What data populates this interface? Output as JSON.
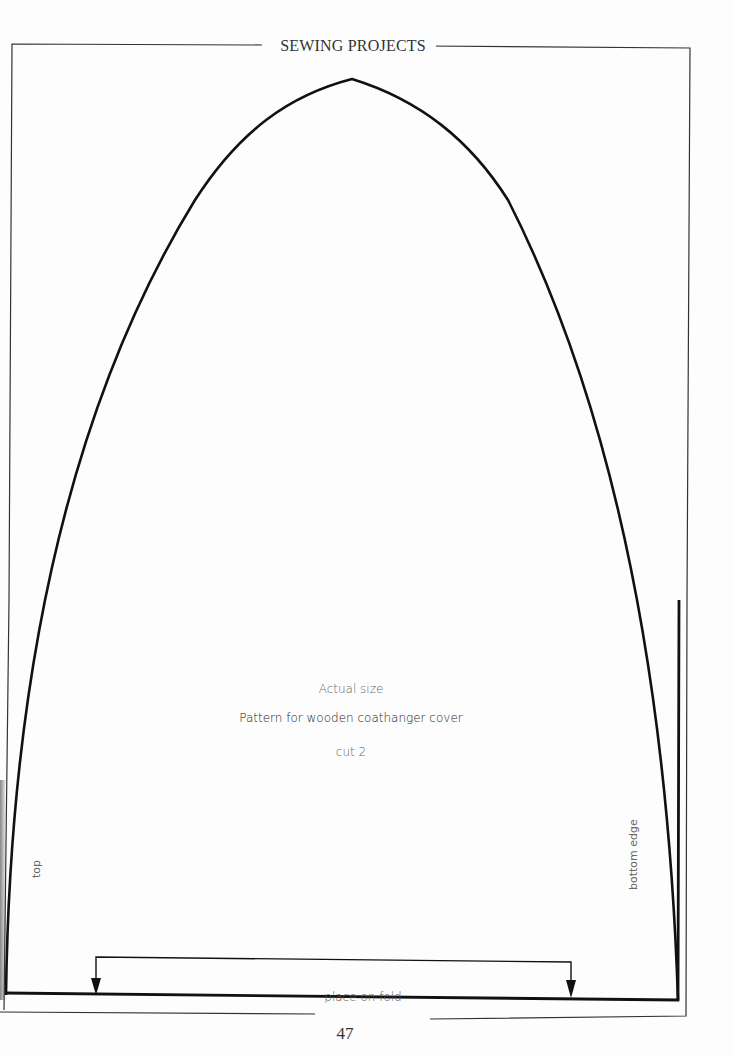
{
  "header": {
    "title": "SEWING PROJECTS"
  },
  "pattern": {
    "scale_note": "Actual size",
    "title": "Pattern for wooden coathanger cover",
    "cut_instruction": "cut 2",
    "left_edge_label": "top",
    "right_edge_label": "bottom edge",
    "fold_label": "place on fold"
  },
  "footer": {
    "page_number": "47"
  },
  "colors": {
    "line": "#111111",
    "frame": "#333333",
    "paper": "#fdfdfd"
  }
}
